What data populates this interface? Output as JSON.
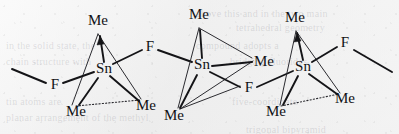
{
  "figure": {
    "kind": "chemical-structure-diagram",
    "background_color": "#f2f2f2",
    "ink_color": "#141417"
  },
  "ghost_text": [
    {
      "text": "above this and in the two main",
      "x": 196,
      "y": 8,
      "size": 10
    },
    {
      "text": "tetrahedral geometry",
      "x": 236,
      "y": 22,
      "size": 10
    },
    {
      "text": "in the solid state, the",
      "x": 6,
      "y": 40,
      "size": 10
    },
    {
      "text": "compound adopts a",
      "x": 196,
      "y": 40,
      "size": 10
    },
    {
      "text": "chain structure with",
      "x": 6,
      "y": 56,
      "size": 10
    },
    {
      "text": "bridging fluorides",
      "x": 230,
      "y": 56,
      "size": 10
    },
    {
      "text": "tin atoms are",
      "x": 6,
      "y": 96,
      "size": 10
    },
    {
      "text": "five-coordinate",
      "x": 232,
      "y": 96,
      "size": 10
    },
    {
      "text": "planar arrangement of the methyl",
      "x": 6,
      "y": 112,
      "size": 10
    },
    {
      "text": "trigonal bipyramid",
      "x": 246,
      "y": 124,
      "size": 10
    }
  ],
  "units": [
    {
      "id": "unit-1",
      "center": {
        "label": "Sn",
        "x": 104,
        "y": 70
      },
      "substituents": [
        {
          "label": "Me",
          "x": 98,
          "y": 22,
          "role": "apical-methyl"
        },
        {
          "label": "F",
          "x": 150,
          "y": 48,
          "role": "bridging-fluoride"
        },
        {
          "label": "Me",
          "x": 76,
          "y": 113,
          "role": "basal-methyl"
        },
        {
          "label": "Me",
          "x": 146,
          "y": 107,
          "role": "basal-methyl"
        },
        {
          "label": "F",
          "x": 55,
          "y": 86,
          "role": "bridging-fluoride"
        }
      ]
    },
    {
      "id": "unit-2",
      "center": {
        "label": "Sn",
        "x": 202,
        "y": 66
      },
      "substituents": [
        {
          "label": "Me",
          "x": 199,
          "y": 16,
          "role": "apical-methyl"
        },
        {
          "label": "Me",
          "x": 264,
          "y": 63,
          "role": "basal-methyl"
        },
        {
          "label": "F",
          "x": 249,
          "y": 89,
          "role": "bridging-fluoride"
        },
        {
          "label": "Me",
          "x": 174,
          "y": 117,
          "role": "basal-methyl"
        }
      ]
    },
    {
      "id": "unit-3",
      "center": {
        "label": "Sn",
        "x": 303,
        "y": 68
      },
      "substituents": [
        {
          "label": "Me",
          "x": 295,
          "y": 19,
          "role": "apical-methyl"
        },
        {
          "label": "F",
          "x": 345,
          "y": 44,
          "role": "bridging-fluoride"
        },
        {
          "label": "Me",
          "x": 276,
          "y": 113,
          "role": "basal-methyl"
        },
        {
          "label": "Me",
          "x": 345,
          "y": 100,
          "role": "basal-methyl"
        }
      ]
    }
  ],
  "chain_termini": [
    {
      "id": "left-open-bond",
      "from": {
        "x": 12,
        "y": 69
      },
      "to": {
        "x": 46,
        "y": 83
      }
    },
    {
      "id": "right-open-bond",
      "from": {
        "x": 354,
        "y": 50
      },
      "to": {
        "x": 392,
        "y": 72
      }
    }
  ]
}
